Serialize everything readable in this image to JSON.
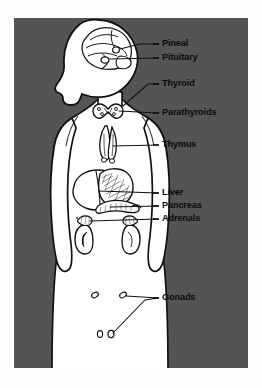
{
  "figure": {
    "panel": {
      "background_color": "#545454",
      "outer_background_color": "#fdfdfd",
      "x": 14,
      "y": 18,
      "width": 234,
      "height": 350
    },
    "body": {
      "fill_color": "#ffffff",
      "outline_color": "#111111",
      "shadow_color": "#3c3c3c",
      "description": "Front-facing torso silhouette with head in left profile, arms at sides, cropped at the hips by the lower panel edge"
    },
    "organ_line_color": "#1a1a1a",
    "leader_line_color": "#111111",
    "label_text_color": "#0b0b0b"
  },
  "labels": [
    {
      "id": "pineal",
      "text": "Pineal",
      "text_x": 162,
      "text_y": 44,
      "leader": [
        [
          155,
          44
        ],
        [
          140,
          44
        ],
        [
          120,
          50
        ]
      ]
    },
    {
      "id": "pituitary",
      "text": "Pituitary",
      "text_x": 162,
      "text_y": 58,
      "leader": [
        [
          155,
          58
        ],
        [
          142,
          58
        ],
        [
          112,
          59
        ]
      ]
    },
    {
      "id": "thyroid",
      "text": "Thyroid",
      "text_x": 162,
      "text_y": 84,
      "leader": [
        [
          155,
          84
        ],
        [
          148,
          84
        ],
        [
          122,
          106
        ]
      ]
    },
    {
      "id": "parathyroids",
      "text": "Parathyroids",
      "text_x": 162,
      "text_y": 113,
      "leader": [
        [
          155,
          113
        ],
        [
          140,
          113
        ],
        [
          120,
          113
        ]
      ]
    },
    {
      "id": "thymus",
      "text": "Thymus",
      "text_x": 162,
      "text_y": 145,
      "leader": [
        [
          155,
          145
        ],
        [
          120,
          145
        ],
        [
          112,
          146
        ]
      ]
    },
    {
      "id": "liver",
      "text": "Liver",
      "text_x": 162,
      "text_y": 193,
      "leader": [
        [
          155,
          193
        ],
        [
          100,
          193
        ],
        [
          98,
          192
        ]
      ]
    },
    {
      "id": "pancreas",
      "text": "Pancreas",
      "text_x": 162,
      "text_y": 206,
      "leader": [
        [
          155,
          206
        ],
        [
          112,
          206
        ],
        [
          108,
          207
        ]
      ]
    },
    {
      "id": "adrenals",
      "text": "Adrenals",
      "text_x": 162,
      "text_y": 219,
      "leader": [
        [
          155,
          219
        ],
        [
          90,
          221
        ],
        [
          86,
          222
        ]
      ]
    },
    {
      "id": "gonads",
      "text": "Gonads",
      "text_x": 162,
      "text_y": 298,
      "leader_a": [
        [
          155,
          298
        ],
        [
          128,
          296
        ],
        [
          124,
          296
        ]
      ],
      "leader_b": [
        [
          155,
          298
        ],
        [
          140,
          302
        ],
        [
          112,
          334
        ]
      ]
    }
  ],
  "organs": [
    {
      "id": "pineal-gland",
      "label": "Pineal",
      "region": "brain",
      "cx": 116,
      "cy": 50
    },
    {
      "id": "pituitary-gland",
      "label": "Pituitary",
      "region": "brain",
      "cx": 108,
      "cy": 60
    },
    {
      "id": "thyroid-gland",
      "label": "Thyroid",
      "region": "neck",
      "cx": 110,
      "cy": 106
    },
    {
      "id": "parathyroid-glands",
      "label": "Parathyroids",
      "region": "neck",
      "cx": 113,
      "cy": 110
    },
    {
      "id": "thymus-gland",
      "label": "Thymus",
      "region": "chest",
      "cx": 108,
      "cy": 140
    },
    {
      "id": "liver",
      "label": "Liver",
      "region": "abdomen",
      "cx": 95,
      "cy": 192
    },
    {
      "id": "pancreas",
      "label": "Pancreas",
      "region": "abdomen",
      "cx": 112,
      "cy": 205
    },
    {
      "id": "adrenal-left",
      "label": "Adrenals",
      "region": "abdomen",
      "cx": 86,
      "cy": 222
    },
    {
      "id": "adrenal-right",
      "label": "Adrenals",
      "region": "abdomen",
      "cx": 128,
      "cy": 222
    },
    {
      "id": "ovary-left",
      "label": "Gonads",
      "region": "pelvis",
      "cx": 95,
      "cy": 295
    },
    {
      "id": "ovary-right",
      "label": "Gonads",
      "region": "pelvis",
      "cx": 123,
      "cy": 295
    },
    {
      "id": "testis-left",
      "label": "Gonads",
      "region": "pelvis",
      "cx": 101,
      "cy": 334
    },
    {
      "id": "testis-right",
      "label": "Gonads",
      "region": "pelvis",
      "cx": 111,
      "cy": 334
    }
  ]
}
